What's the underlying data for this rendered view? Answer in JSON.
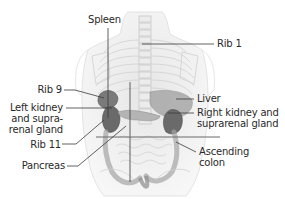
{
  "diagram": {
    "labels": {
      "spleen": "Spleen",
      "rib1": "Rib 1",
      "rib9": "Rib 9",
      "left_kidney_l1": "Left kidney",
      "left_kidney_l2": "and supra-",
      "left_kidney_l3": "renal gland",
      "rib11": "Rib 11",
      "pancreas": "Pancreas",
      "liver": "Liver",
      "right_kidney_l1": "Right kidney and",
      "right_kidney_l2": "suprarenal gland",
      "ascending_l1": "Ascending",
      "ascending_l2": "colon"
    },
    "colors": {
      "leader_line": "#3a3a3a",
      "body_outline": "#d8d8d8",
      "skeleton": "#c4c4c4",
      "organ_dark": "#6e6e6e",
      "organ_mid": "#9a9a9a",
      "organ_light": "#bdbdbd",
      "text": "#2a2a2a"
    }
  }
}
